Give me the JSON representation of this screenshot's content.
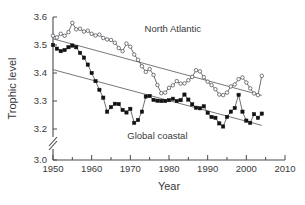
{
  "chart_data": {
    "type": "line",
    "title": "",
    "xlabel": "Year",
    "ylabel": "Trophic level",
    "xlim": [
      1950,
      2010
    ],
    "ylim": [
      3.0,
      3.6
    ],
    "y_axis_break": {
      "between": [
        3.0,
        3.2
      ],
      "style": "double-slash"
    },
    "grid": false,
    "legend_position": "inline-annotations",
    "xticks": [
      1950,
      1960,
      1970,
      1980,
      1990,
      2000,
      2010
    ],
    "xtick_labels": [
      "1950",
      "1960",
      "1970",
      "1980",
      "1990",
      "2000",
      "2010"
    ],
    "xminor_ticks": [
      1955,
      1965,
      1975,
      1985,
      1995,
      2005
    ],
    "yticks": [
      3.0,
      3.2,
      3.3,
      3.4,
      3.5,
      3.6
    ],
    "ytick_labels": [
      "3.0",
      "3.2",
      "3.3",
      "3.4",
      "3.5",
      "3.6"
    ],
    "annotations": [
      {
        "text": "North Atlantic",
        "x": 1981,
        "y": 3.545
      },
      {
        "text": "Global coastal",
        "x": 1977,
        "y": 3.163
      }
    ],
    "series": [
      {
        "name": "North Atlantic",
        "marker": "open-circle",
        "x": [
          1950,
          1951,
          1952,
          1953,
          1954,
          1955,
          1956,
          1957,
          1958,
          1959,
          1960,
          1961,
          1962,
          1963,
          1964,
          1965,
          1966,
          1967,
          1968,
          1969,
          1970,
          1971,
          1972,
          1973,
          1974,
          1975,
          1976,
          1977,
          1978,
          1979,
          1980,
          1981,
          1982,
          1983,
          1984,
          1985,
          1986,
          1987,
          1988,
          1989,
          1990,
          1991,
          1992,
          1993,
          1994,
          1995,
          1996,
          1997,
          1998,
          1999,
          2000,
          2001,
          2002,
          2003,
          2004
        ],
        "values": [
          3.533,
          3.527,
          3.54,
          3.533,
          3.546,
          3.579,
          3.556,
          3.558,
          3.548,
          3.551,
          3.54,
          3.534,
          3.537,
          3.525,
          3.52,
          3.518,
          3.508,
          3.489,
          3.478,
          3.505,
          3.494,
          3.466,
          3.447,
          3.424,
          3.404,
          3.414,
          3.393,
          3.357,
          3.328,
          3.33,
          3.347,
          3.356,
          3.371,
          3.362,
          3.363,
          3.374,
          3.386,
          3.41,
          3.406,
          3.385,
          3.369,
          3.357,
          3.342,
          3.323,
          3.321,
          3.33,
          3.352,
          3.359,
          3.378,
          3.384,
          3.366,
          3.345,
          3.327,
          3.321,
          3.39
        ],
        "trendline": {
          "x": [
            1950,
            2004
          ],
          "y": [
            3.522,
            3.32
          ]
        }
      },
      {
        "name": "Global coastal",
        "marker": "filled-square",
        "x": [
          1950,
          1951,
          1952,
          1953,
          1954,
          1955,
          1956,
          1957,
          1958,
          1959,
          1960,
          1961,
          1962,
          1963,
          1964,
          1965,
          1966,
          1967,
          1968,
          1969,
          1970,
          1971,
          1972,
          1973,
          1974,
          1975,
          1976,
          1977,
          1978,
          1979,
          1980,
          1981,
          1982,
          1983,
          1984,
          1985,
          1986,
          1987,
          1988,
          1989,
          1990,
          1991,
          1992,
          1993,
          1994,
          1995,
          1996,
          1997,
          1998,
          1999,
          2000,
          2001,
          2002,
          2003,
          2004
        ],
        "values": [
          3.5,
          3.487,
          3.478,
          3.482,
          3.492,
          3.498,
          3.492,
          3.472,
          3.455,
          3.43,
          3.4,
          3.371,
          3.34,
          3.312,
          3.262,
          3.278,
          3.29,
          3.289,
          3.268,
          3.259,
          3.272,
          3.222,
          3.232,
          3.262,
          3.316,
          3.318,
          3.304,
          3.301,
          3.3,
          3.3,
          3.303,
          3.308,
          3.3,
          3.303,
          3.323,
          3.305,
          3.288,
          3.276,
          3.274,
          3.281,
          3.258,
          3.243,
          3.24,
          3.22,
          3.209,
          3.243,
          3.262,
          3.275,
          3.322,
          3.262,
          3.23,
          3.222,
          3.253,
          3.24,
          3.255
        ],
        "trendline": {
          "x": [
            1950,
            2004
          ],
          "y": [
            3.412,
            3.213
          ]
        }
      }
    ]
  }
}
